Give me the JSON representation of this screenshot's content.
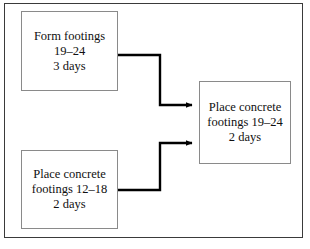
{
  "diagram": {
    "type": "flowchart",
    "background_color": "#ffffff",
    "frame_color": "#3a3a3a",
    "box_border_color": "#8a8a8a",
    "connector_color": "#000000",
    "text_color": "#101010",
    "nodes": [
      {
        "id": "form-footings",
        "lines": [
          "Form footings",
          "19–24",
          "3 days"
        ],
        "activity": "Form footings",
        "stations": "19–24",
        "duration": "3 days"
      },
      {
        "id": "place-concrete-12-18",
        "lines": [
          "Place concrete",
          "footings 12–18",
          "2 days"
        ],
        "activity": "Place concrete footings",
        "stations": "12–18",
        "duration": "2 days"
      },
      {
        "id": "place-concrete-19-24",
        "lines": [
          "Place concrete",
          "footings 19–24",
          "2 days"
        ],
        "activity": "Place concrete footings",
        "stations": "19–24",
        "duration": "2 days"
      }
    ],
    "connectors": [
      {
        "id": "form-footings-to-place-concrete-19-24",
        "from": "form-footings",
        "to": "place-concrete-19-24",
        "arrowhead": "solid-triangle"
      },
      {
        "id": "place-concrete-12-18-to-place-concrete-19-24",
        "from": "place-concrete-12-18",
        "to": "place-concrete-19-24",
        "arrowhead": "solid-triangle"
      }
    ]
  }
}
